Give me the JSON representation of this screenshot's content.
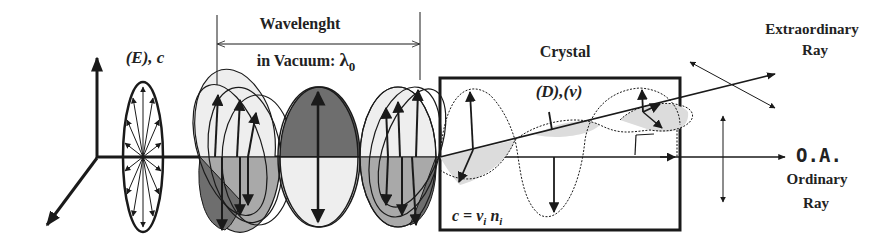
{
  "diagram": {
    "labels": {
      "wavelength_line1": "Wavelenght",
      "wavelength_line2": "in Vacuum: ",
      "lambda_symbol": "λ",
      "lambda_subscript": "0",
      "incident_field": "(E), c",
      "crystal": "Crystal",
      "displacement_freq": "(D),(ν)",
      "speed_relation_c": "c = ",
      "speed_relation_nu": "ν",
      "speed_relation_nu_sub": "i",
      "speed_relation_n": " n",
      "speed_relation_n_sub": "i",
      "extraordinary_line1": "Extraordinary",
      "extraordinary_line2": "Ray",
      "optic_axis": "O.A.",
      "ordinary_line1": "Ordinary",
      "ordinary_line2": "Ray"
    },
    "colors": {
      "stroke": "#1a1a1a",
      "dark_fill": "#6e6e6e",
      "mid_fill": "#a9a9a9",
      "light_fill": "#dcdcdc",
      "very_light_fill": "#eeeeee",
      "background": "#ffffff"
    }
  }
}
